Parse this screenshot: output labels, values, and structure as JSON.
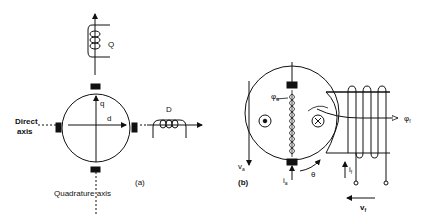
{
  "figure_a": {
    "caption": "(a)",
    "coil_q_label": "Q",
    "coil_d_label": "D",
    "axis_q_label": "q",
    "axis_d_label": "d",
    "direct_axis_label_line1": "Direct",
    "direct_axis_label_line2": "axis",
    "quadrature_axis_label": "Quadrature  axis"
  },
  "figure_b": {
    "caption": "(b)",
    "va_label": "v",
    "va_sub": "a",
    "ia_label": "i",
    "ia_sub": "a",
    "theta_label": "θ",
    "phi_a_label": "φ",
    "phi_a_sub": "a",
    "phi_f_label": "φ",
    "phi_f_sub": "f",
    "if_label": "i",
    "if_sub": "f",
    "vf_label": "v",
    "vf_sub": "f"
  }
}
